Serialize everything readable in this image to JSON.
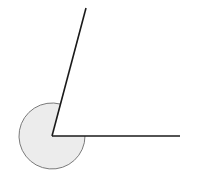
{
  "diagram": {
    "type": "reflex-angle",
    "vertex": [
      52,
      136
    ],
    "ray_upper_end": [
      86,
      8
    ],
    "ray_horizontal_end": [
      180,
      136
    ],
    "arc_radius": 33,
    "colors": {
      "ray": "#1a1a1a",
      "arc_fill": "#ececec",
      "arc_stroke": "#7a7a7a",
      "background": "#ffffff"
    }
  }
}
